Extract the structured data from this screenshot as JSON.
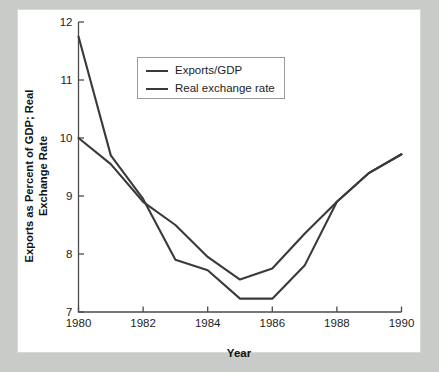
{
  "chart_data": {
    "type": "line",
    "title": "",
    "xlabel": "Year",
    "ylabel": "Exports as Percent of GDP; Real Exchange Rate",
    "ylabel_line1": "Exports as Percent of GDP; Real",
    "ylabel_line2": "Exchange Rate",
    "x": [
      1980,
      1981,
      1982,
      1983,
      1984,
      1985,
      1986,
      1987,
      1988,
      1989,
      1990
    ],
    "xlim": [
      1980,
      1990
    ],
    "ylim": [
      7,
      12
    ],
    "xticks": [
      1980,
      1982,
      1984,
      1986,
      1988,
      1990
    ],
    "xtick_labels": [
      "1980",
      "1982",
      "1984",
      "1986",
      "1988",
      "1990"
    ],
    "yticks": [
      7,
      8,
      9,
      10,
      11,
      12
    ],
    "ytick_labels": [
      "7",
      "8",
      "9",
      "10",
      "11",
      "12"
    ],
    "grid": false,
    "legend_position": "upper-center-left",
    "series": [
      {
        "name": "Exports/GDP",
        "color": "#3a3a3a",
        "values": [
          10.0,
          9.55,
          8.9,
          8.5,
          7.95,
          7.56,
          7.75,
          8.35,
          8.9,
          9.4,
          9.72
        ]
      },
      {
        "name": "Real exchange rate",
        "color": "#3a3a3a",
        "values": [
          11.75,
          9.7,
          8.95,
          7.9,
          7.72,
          7.23,
          7.23,
          7.8,
          8.9,
          9.4,
          9.72
        ]
      }
    ]
  },
  "legend": {
    "items": [
      {
        "label": "Exports/GDP"
      },
      {
        "label": "Real exchange rate"
      }
    ]
  },
  "axes": {
    "x_title": "Year",
    "y_title_line1": "Exports as Percent of GDP; Real",
    "y_title_line2": "Exchange Rate"
  },
  "colors": {
    "background": "#c9cbc9",
    "panel": "#ffffff",
    "line": "#3a3a3a",
    "axis": "#4b4b4b",
    "text": "#1d1d1d"
  }
}
